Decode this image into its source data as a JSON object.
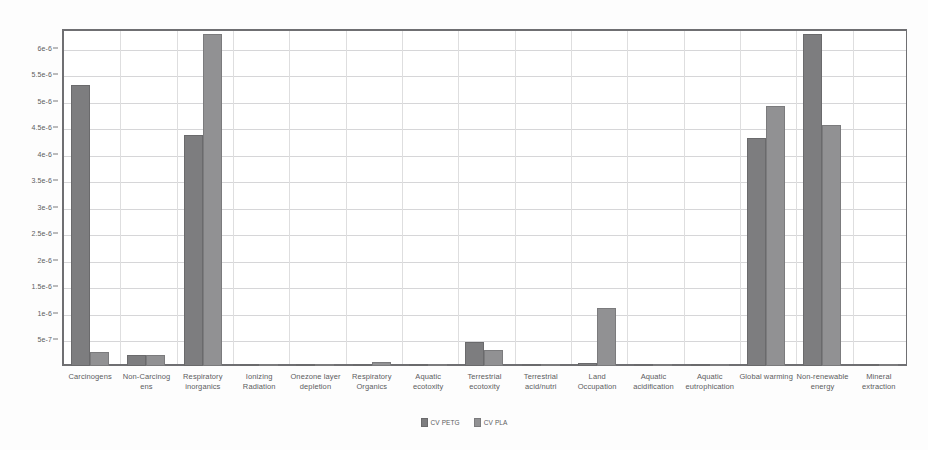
{
  "chart_data": {
    "type": "bar",
    "title": "",
    "subtitle": "",
    "xlabel": "",
    "ylabel": "",
    "ylim": [
      0,
      6.35e-06
    ],
    "ytick_values": [
      5e-07,
      1e-06,
      1.5e-06,
      2e-06,
      2.5e-06,
      3e-06,
      3.5e-06,
      4e-06,
      4.5e-06,
      5e-06,
      5.5e-06,
      6e-06
    ],
    "ytick_labels": [
      "5e-7",
      "1e-6",
      "1.5e-6",
      "2e-6",
      "2.5e-6",
      "3e-6",
      "3.5e-6",
      "4e-6",
      "4.5e-6",
      "5e-6",
      "5.5e-6",
      "6e-6"
    ],
    "grid": true,
    "legend_position": "bottom",
    "categories": [
      "Carcinogens",
      "Non-Carcinog ens",
      "Respiratory inorganics",
      "Ionizing Radiation",
      "Onezone layer depletion",
      "Respiratory Organics",
      "Aquatic ecotoxity",
      "Terrestrial ecotoxity",
      "Terrestrial acid/nutri",
      "Land Occupation",
      "Aquatic acidification",
      "Aquatic eutrophication",
      "Global warming",
      "Non-renewable energy",
      "Mineral extraction"
    ],
    "series": [
      {
        "name": "CV PETG",
        "color": "#7d7d7f",
        "values": [
          5.3e-06,
          2e-07,
          4.35e-06,
          1.5e-08,
          1e-09,
          1.5e-08,
          1e-08,
          4.5e-07,
          4e-08,
          5e-08,
          3e-09,
          2e-09,
          4.3e-06,
          6.25e-06,
          1e-08
        ]
      },
      {
        "name": "CV PLA",
        "color": "#919193",
        "values": [
          2.6e-07,
          2e-07,
          6.25e-06,
          1e-08,
          1e-09,
          8e-08,
          8e-09,
          3e-07,
          4.5e-08,
          1.1e-06,
          3e-09,
          2e-09,
          4.9e-06,
          4.55e-06,
          2.5e-08
        ]
      }
    ]
  }
}
